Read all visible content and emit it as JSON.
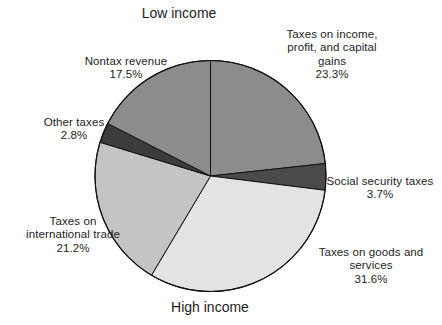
{
  "figure": {
    "top_title": "Low income",
    "bottom_title": "High income",
    "background": "#ffffff",
    "text_color": "#1d1d1d"
  },
  "chart_data": {
    "type": "pie",
    "title": "Low income",
    "subtitle": "High income",
    "xlabel": "",
    "ylabel": "",
    "legend_position": "outside-callouts",
    "grid": false,
    "start_angle_deg": 0,
    "direction": "clockwise",
    "units": "percent",
    "categories": [
      "Taxes on income, profit, and capital gains",
      "Social security taxes",
      "Taxes on goods and services",
      "Taxes on international trade",
      "Other taxes",
      "Nontax revenue"
    ],
    "values": [
      23.3,
      3.7,
      31.6,
      21.2,
      2.8,
      17.5
    ],
    "slices": [
      {
        "id": "income",
        "name": "Taxes on income, profit, and capital gains",
        "label": "Taxes on income,\nprofit, and capital\ngains",
        "percent_text": "23.3%",
        "value": 23.3,
        "color": "#8c8c8c"
      },
      {
        "id": "social",
        "name": "Social security taxes",
        "label": "Social security taxes",
        "percent_text": "3.7%",
        "value": 3.7,
        "color": "#4a4a4a"
      },
      {
        "id": "goods",
        "name": "Taxes on goods and services",
        "label": "Taxes on goods and\nservices",
        "percent_text": "31.6%",
        "value": 31.6,
        "color": "#e3e3e3"
      },
      {
        "id": "trade",
        "name": "Taxes on international trade",
        "label": "Taxes on\ninternational trade",
        "percent_text": "21.2%",
        "value": 21.2,
        "color": "#c4c4c4"
      },
      {
        "id": "other",
        "name": "Other taxes",
        "label": "Other taxes",
        "percent_text": "2.8%",
        "value": 2.8,
        "color": "#3c3c3c"
      },
      {
        "id": "nontax",
        "name": "Nontax revenue",
        "label": "Nontax revenue",
        "percent_text": "17.5%",
        "value": 17.5,
        "color": "#8c8c8c"
      }
    ]
  }
}
